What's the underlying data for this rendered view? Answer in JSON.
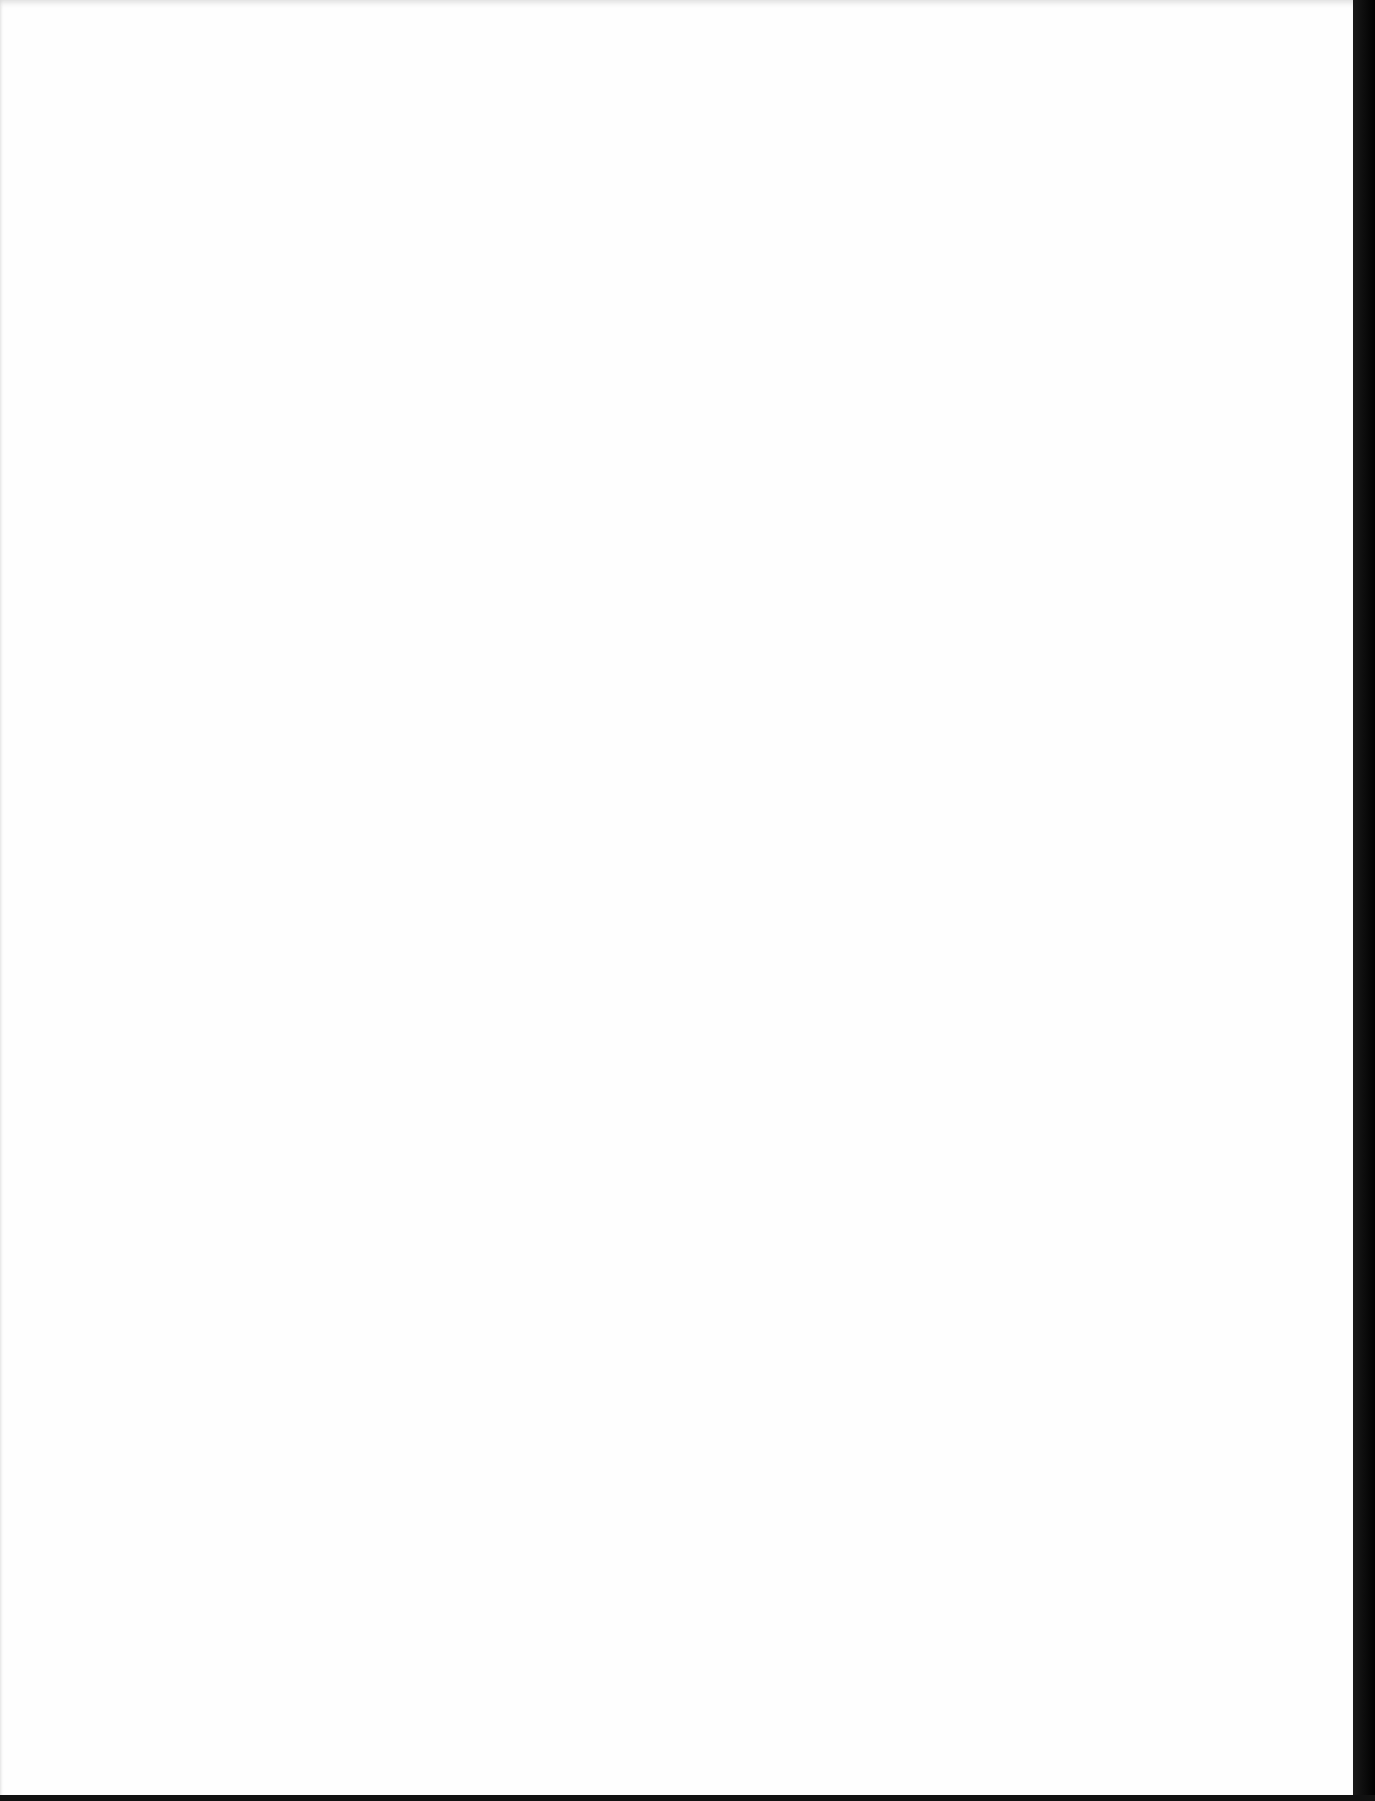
{
  "document": {
    "type": "scanned-page",
    "content": "",
    "colors": {
      "paper": "#fefefe",
      "border": "#000000"
    }
  }
}
